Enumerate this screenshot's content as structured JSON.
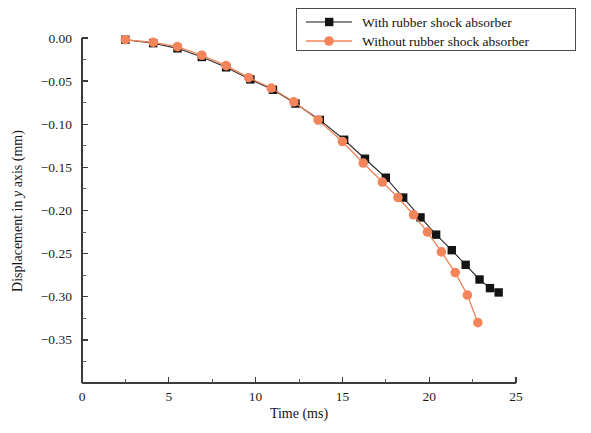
{
  "chart_data": {
    "type": "line",
    "title": "",
    "xlabel": "Time (ms)",
    "ylabel": "Displacement in y axis (mm)",
    "xlim": [
      0,
      25
    ],
    "ylim": [
      -0.4,
      0.0
    ],
    "xticks": [
      0,
      5,
      10,
      15,
      20,
      25
    ],
    "yticks": [
      0.0,
      -0.05,
      -0.1,
      -0.15,
      -0.2,
      -0.25,
      -0.3,
      -0.35
    ],
    "xtick_labels": [
      "0",
      "5",
      "10",
      "15",
      "20",
      "25"
    ],
    "ytick_labels": [
      "0.00",
      "-0.05",
      "-0.10",
      "-0.15",
      "-0.20",
      "-0.25",
      "-0.30",
      "-0.35"
    ],
    "grid": false,
    "legend_position": "top-right",
    "series": [
      {
        "name": "With rubber shock absorber",
        "color": "#141414",
        "marker": "square",
        "x": [
          2.5,
          4.1,
          5.5,
          6.9,
          8.3,
          9.7,
          11.0,
          12.3,
          13.7,
          15.1,
          16.3,
          17.5,
          18.5,
          19.5,
          20.4,
          21.3,
          22.1,
          22.9,
          23.5,
          24.0
        ],
        "y": [
          -0.002,
          -0.006,
          -0.012,
          -0.022,
          -0.034,
          -0.048,
          -0.06,
          -0.076,
          -0.095,
          -0.118,
          -0.14,
          -0.162,
          -0.185,
          -0.208,
          -0.228,
          -0.246,
          -0.263,
          -0.28,
          -0.29,
          -0.295
        ]
      },
      {
        "name": "Without rubber shock absorber",
        "color": "#f4845a",
        "marker": "circle",
        "x": [
          2.5,
          4.1,
          5.5,
          6.9,
          8.3,
          9.6,
          10.9,
          12.2,
          13.6,
          15.0,
          16.2,
          17.3,
          18.2,
          19.1,
          19.9,
          20.7,
          21.5,
          22.2,
          22.8
        ],
        "y": [
          -0.002,
          -0.005,
          -0.01,
          -0.02,
          -0.032,
          -0.046,
          -0.058,
          -0.074,
          -0.095,
          -0.12,
          -0.145,
          -0.167,
          -0.185,
          -0.205,
          -0.225,
          -0.248,
          -0.272,
          -0.298,
          -0.33
        ]
      }
    ],
    "legend": [
      {
        "label": "With rubber shock absorber",
        "color": "#141414",
        "marker": "square"
      },
      {
        "label": "Without rubber shock absorber",
        "color": "#f4845a",
        "marker": "circle"
      }
    ]
  }
}
